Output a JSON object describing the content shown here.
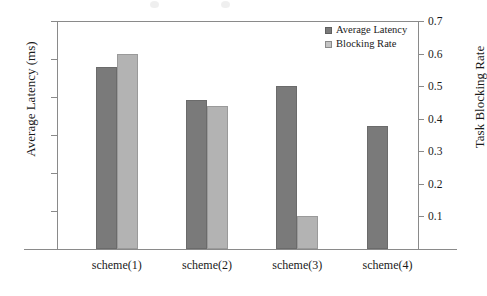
{
  "chart_data": {
    "type": "bar",
    "title": "",
    "xlabel": "",
    "categories": [
      "scheme(1)",
      "scheme(2)",
      "scheme(3)",
      "scheme(4)"
    ],
    "series": [
      {
        "name": "Average Latency",
        "axis": "left",
        "color": "#7a7a7a",
        "values": [
          480,
          393,
          430,
          325
        ]
      },
      {
        "name": "Blocking Rate",
        "axis": "right",
        "color": "#b3b3b3",
        "values": [
          0.6,
          0.44,
          0.1,
          null
        ]
      }
    ],
    "left_axis": {
      "label": "Average Latency (ms)",
      "ticks": [
        "600",
        "500",
        "400",
        "300",
        "200",
        "100"
      ],
      "tick_values": [
        600,
        500,
        400,
        300,
        200,
        100
      ],
      "ylim": [
        0,
        600
      ]
    },
    "right_axis": {
      "label": "Task Blocking Rate",
      "ticks": [
        "0.7",
        "0.6",
        "0.5",
        "0.4",
        "0.3",
        "0.2",
        "0.1"
      ],
      "tick_values": [
        0.7,
        0.6,
        0.5,
        0.4,
        0.3,
        0.2,
        0.1
      ],
      "ylim": [
        0,
        0.7
      ]
    },
    "grid": false,
    "legend_position": "top-right"
  },
  "legend": {
    "entries": [
      {
        "label": "Average Latency",
        "swatch": "dark"
      },
      {
        "label": "Blocking Rate",
        "swatch": "light"
      }
    ]
  }
}
